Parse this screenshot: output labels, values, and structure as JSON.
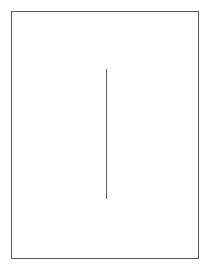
{
  "figure": {
    "background_color": "#ffffff",
    "width": 209,
    "height": 269,
    "caption": ""
  },
  "shapes": {
    "frame": {
      "name": "rectangle-border",
      "stroke_color": "#555a5e",
      "stroke_width": 1,
      "fill": "none",
      "x": 11,
      "y": 11,
      "width": 188,
      "height": 248,
      "label": ""
    },
    "line": {
      "name": "vertical-line",
      "stroke_color": "#5a5f63",
      "stroke_width": 1,
      "x": 106,
      "y_start": 69,
      "y_end": 199,
      "length": 130,
      "orientation": "vertical",
      "label": ""
    }
  }
}
